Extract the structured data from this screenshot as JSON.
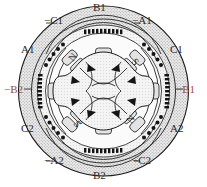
{
  "figure": {
    "title": "",
    "type": "motor-cross-section",
    "colors": {
      "outline": "#1a1a1a",
      "stator_fill": "#d8d8d8",
      "rotor_fill": "#e8e8e8",
      "coil_dot": "#1a1a1a",
      "label": "#2b2b2b",
      "label_accent": "#9e4b40",
      "background": "#ffffff"
    },
    "rotor": {
      "pole_count": 4,
      "pole_marks": [
        {
          "name": "pole-mark-n-upper-left",
          "text": "N",
          "x": 73,
          "y": 58,
          "rotate": -48
        },
        {
          "name": "pole-mark-s-upper-right",
          "text": "S",
          "x": 131,
          "y": 58,
          "rotate": 42
        },
        {
          "name": "pole-mark-s-lower-left",
          "text": "S",
          "x": 73,
          "y": 128,
          "rotate": 42
        },
        {
          "name": "pole-mark-n-lower-right",
          "text": "N",
          "x": 131,
          "y": 128,
          "rotate": -48
        }
      ]
    },
    "labels": [
      {
        "name": "label-b1-top",
        "text": "B1",
        "x": 93,
        "y": 2,
        "accent": false
      },
      {
        "name": "label-neg-c1",
        "text": "−C1",
        "x": 44,
        "y": 15,
        "accent": false
      },
      {
        "name": "label-neg-a1",
        "text": "−A1",
        "x": 132,
        "y": 15,
        "accent": false
      },
      {
        "name": "label-a1",
        "text": "A1",
        "x": 21,
        "y": 44,
        "accent": false
      },
      {
        "name": "label-c1",
        "text": "C1",
        "x": 170,
        "y": 44,
        "accent": false
      },
      {
        "name": "label-neg-b2",
        "text": "−B2",
        "x": 4,
        "y": 84,
        "accent": true
      },
      {
        "name": "label-neg-b1",
        "text": "−B1",
        "x": 176,
        "y": 84,
        "accent": true
      },
      {
        "name": "label-c2",
        "text": "C2",
        "x": 21,
        "y": 123,
        "accent": false
      },
      {
        "name": "label-a2",
        "text": "A2",
        "x": 170,
        "y": 123,
        "accent": false
      },
      {
        "name": "label-neg-a2",
        "text": "−A2",
        "x": 44,
        "y": 155,
        "accent": false
      },
      {
        "name": "label-neg-c2",
        "text": "−C2",
        "x": 132,
        "y": 155,
        "accent": false
      },
      {
        "name": "label-b2-bottom",
        "text": "B2",
        "x": 93,
        "y": 170,
        "accent": false
      }
    ]
  }
}
